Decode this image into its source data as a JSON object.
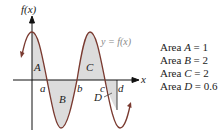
{
  "diagram": {
    "y_axis_label": "f(x)",
    "x_axis_label": "x",
    "curve_label": "y = f(x)",
    "region_labels": {
      "A": "A",
      "B": "B",
      "C": "C",
      "D": "D"
    },
    "tick_labels": {
      "a": "a",
      "b": "b",
      "c": "c",
      "d": "d"
    },
    "colors": {
      "curve": "#7a3a30",
      "fill": "#dcdcdc",
      "axis": "#111111",
      "text": "#222222"
    }
  },
  "legend": {
    "items": [
      {
        "prefix": "Area ",
        "var": "A",
        "suffix": " = 1"
      },
      {
        "prefix": "Area ",
        "var": "B",
        "suffix": " = 2"
      },
      {
        "prefix": "Area ",
        "var": "C",
        "suffix": " = 2"
      },
      {
        "prefix": "Area ",
        "var": "D",
        "suffix": " = 0.6"
      }
    ]
  }
}
